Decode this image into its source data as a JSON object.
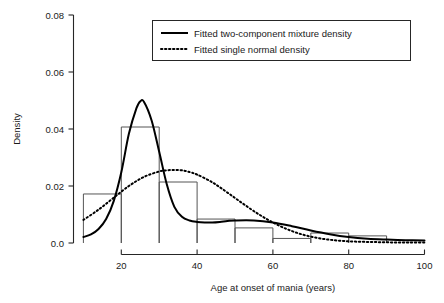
{
  "chart_data": {
    "type": "bar",
    "title": "",
    "subtitle": "",
    "xlabel": "Age at onset of mania (years)",
    "ylabel": "Density",
    "xlim": [
      10,
      100
    ],
    "ylim": [
      0.0,
      0.08
    ],
    "grid": false,
    "xticks": [
      20,
      40,
      60,
      80,
      100
    ],
    "xtick_labels": [
      "20",
      "40",
      "60",
      "80",
      "100"
    ],
    "yticks": [
      0.0,
      0.02,
      0.04,
      0.06,
      0.08
    ],
    "ytick_labels": [
      "0.0",
      "0.02",
      "0.04",
      "0.06",
      "0.08"
    ],
    "legend_position": "top-center",
    "histogram": {
      "name": "Age at onset histogram",
      "bin_edges": [
        10,
        20,
        30,
        40,
        50,
        60,
        70,
        80,
        90
      ],
      "bin_labels": [
        "10-20",
        "20-30",
        "30-40",
        "40-50",
        "50-60",
        "60-70",
        "70-80",
        "80-90"
      ],
      "densities": [
        0.0172,
        0.0407,
        0.0214,
        0.0084,
        0.0053,
        0.0016,
        0.0035,
        0.0025
      ]
    },
    "series": [
      {
        "name": "Fitted two-component mixture density",
        "style": "solid",
        "x": [
          10,
          12,
          14,
          16,
          18,
          20,
          22,
          24,
          25,
          26,
          28,
          30,
          32,
          34,
          36,
          38,
          40,
          42,
          44,
          46,
          48,
          50,
          55,
          60,
          65,
          70,
          75,
          80,
          85,
          90,
          95,
          100
        ],
        "y": [
          0.0021,
          0.003,
          0.0049,
          0.0084,
          0.0147,
          0.0248,
          0.0383,
          0.0473,
          0.0497,
          0.0495,
          0.043,
          0.032,
          0.0206,
          0.0127,
          0.0092,
          0.0079,
          0.0074,
          0.0072,
          0.0072,
          0.0074,
          0.0077,
          0.0079,
          0.0079,
          0.0072,
          0.0059,
          0.0044,
          0.0031,
          0.0021,
          0.0015,
          0.0012,
          0.001,
          0.0009
        ]
      },
      {
        "name": "Fitted single normal density",
        "style": "dotted",
        "x": [
          10,
          14,
          18,
          22,
          26,
          30,
          32,
          34,
          36,
          38,
          40,
          44,
          48,
          52,
          56,
          60,
          64,
          68,
          72,
          76,
          80,
          84,
          88,
          92,
          96,
          100
        ],
        "y": [
          0.0081,
          0.0117,
          0.0159,
          0.02,
          0.0232,
          0.0251,
          0.0255,
          0.0256,
          0.0255,
          0.0249,
          0.024,
          0.0213,
          0.0177,
          0.0139,
          0.0103,
          0.0072,
          0.0047,
          0.0029,
          0.0017,
          0.001,
          0.0006,
          0.0004,
          0.0003,
          0.0002,
          0.0002,
          0.0002
        ]
      }
    ]
  },
  "legend": {
    "items": [
      {
        "label": "Fitted two-component mixture density",
        "style": "solid"
      },
      {
        "label": "Fitted single normal density",
        "style": "dotted"
      }
    ]
  },
  "axes": {
    "y_title": "Density",
    "x_title": "Age at onset of mania (years)",
    "y_tick_0": "0.0",
    "y_tick_1": "0.02",
    "y_tick_2": "0.04",
    "y_tick_3": "0.06",
    "y_tick_4": "0.08",
    "x_tick_0": "20",
    "x_tick_1": "40",
    "x_tick_2": "60",
    "x_tick_3": "80",
    "x_tick_4": "100"
  },
  "colors": {
    "background": "#ffffff",
    "axis": "#262626",
    "curve": "#000000",
    "histogram_outline": "#555555",
    "text": "#1a1a1a"
  }
}
